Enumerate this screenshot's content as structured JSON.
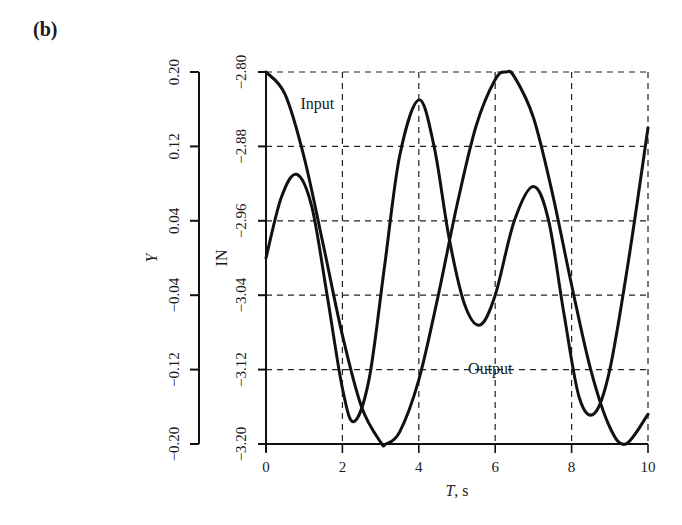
{
  "panel_label": "(b)",
  "chart_data": {
    "type": "line",
    "title": "",
    "xlabel": "T, s",
    "xlim": [
      0,
      10
    ],
    "xticks": [
      0,
      2,
      4,
      6,
      8,
      10
    ],
    "xtick_labels": [
      "0",
      "2",
      "4",
      "6",
      "8",
      "10"
    ],
    "grid": true,
    "axes": [
      {
        "name": "Y",
        "label": "Y",
        "position": "outer-left",
        "ylim": [
          -0.2,
          0.2
        ],
        "ticks": [
          0.2,
          0.12,
          0.04,
          -0.04,
          -0.12,
          -0.2
        ],
        "tick_labels": [
          "0.20",
          "0.12",
          "0.04",
          "−0.04",
          "−0.12",
          "−0.20"
        ]
      },
      {
        "name": "IN",
        "label": "IN",
        "position": "inner-left",
        "ylim": [
          -3.2,
          -2.8
        ],
        "ticks": [
          -2.8,
          -2.88,
          -2.96,
          -3.04,
          -3.12,
          -3.2
        ],
        "tick_labels": [
          "−2.80",
          "−2.88",
          "−2.96",
          "−3.04",
          "−3.12",
          "−3.20"
        ]
      }
    ],
    "series": [
      {
        "name": "Input",
        "axis": "IN",
        "annotation": "Input",
        "x": [
          0,
          0.5,
          1.0,
          1.5,
          2.0,
          2.5,
          3.0,
          3.14,
          3.5,
          4.0,
          4.5,
          5.0,
          5.5,
          6.0,
          6.28,
          6.5,
          7.0,
          7.5,
          8.0,
          8.5,
          9.0,
          9.42,
          10.0
        ],
        "values": [
          -2.8,
          -2.824,
          -2.892,
          -2.986,
          -3.083,
          -3.16,
          -3.198,
          -3.2,
          -3.187,
          -3.131,
          -3.042,
          -2.943,
          -2.858,
          -2.808,
          -2.8,
          -2.805,
          -2.849,
          -2.931,
          -3.029,
          -3.12,
          -3.182,
          -3.2,
          -3.168
        ]
      },
      {
        "name": "Output",
        "axis": "Y",
        "annotation": "Output",
        "x": [
          0,
          0.4,
          0.8,
          1.2,
          1.6,
          2.0,
          2.3,
          2.7,
          3.1,
          3.5,
          4.0,
          4.4,
          4.8,
          5.2,
          5.6,
          6.0,
          6.5,
          7.0,
          7.4,
          7.8,
          8.2,
          8.6,
          9.0,
          9.5,
          10.0
        ],
        "values": [
          0.0,
          0.065,
          0.09,
          0.055,
          -0.04,
          -0.14,
          -0.176,
          -0.13,
          -0.01,
          0.11,
          0.17,
          0.12,
          0.02,
          -0.05,
          -0.072,
          -0.04,
          0.04,
          0.077,
          0.04,
          -0.06,
          -0.15,
          -0.167,
          -0.12,
          0.0,
          0.14
        ]
      }
    ],
    "annotations": [
      {
        "text": "Input",
        "x": 0.9,
        "y_IN": -2.833
      },
      {
        "text": "Output",
        "x": 5.5,
        "y_Y": -0.12
      }
    ]
  }
}
